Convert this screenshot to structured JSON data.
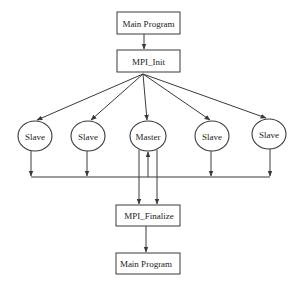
{
  "diagram": {
    "boxes": {
      "main_program_top": "Main Program",
      "mpi_init": "MPI_Init",
      "mpi_finalize": "MPI_Finalize",
      "main_program_bottom": "Main Program"
    },
    "processes": [
      {
        "id": "slave-1",
        "label": "Slave",
        "role": "slave"
      },
      {
        "id": "slave-2",
        "label": "Slave",
        "role": "slave"
      },
      {
        "id": "master",
        "label": "Master",
        "role": "master"
      },
      {
        "id": "slave-3",
        "label": "Slave",
        "role": "slave"
      },
      {
        "id": "slave-4",
        "label": "Slave",
        "role": "slave"
      }
    ],
    "edges": [
      {
        "from": "main_program_top",
        "to": "mpi_init"
      },
      {
        "from": "mpi_init",
        "to": "slave-1"
      },
      {
        "from": "mpi_init",
        "to": "slave-2"
      },
      {
        "from": "mpi_init",
        "to": "master"
      },
      {
        "from": "mpi_init",
        "to": "slave-3"
      },
      {
        "from": "mpi_init",
        "to": "slave-4"
      },
      {
        "from": "slave-1",
        "to": "collect-bus"
      },
      {
        "from": "slave-2",
        "to": "collect-bus"
      },
      {
        "from": "slave-3",
        "to": "collect-bus"
      },
      {
        "from": "slave-4",
        "to": "collect-bus"
      },
      {
        "from": "collect-bus",
        "to": "master"
      },
      {
        "from": "master",
        "to": "mpi_finalize"
      },
      {
        "from": "master",
        "to": "mpi_finalize"
      },
      {
        "from": "mpi_finalize",
        "to": "main_program_bottom"
      }
    ]
  }
}
